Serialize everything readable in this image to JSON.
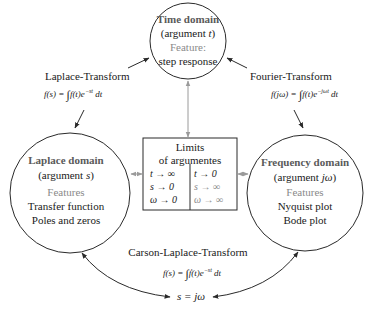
{
  "nodes": {
    "time_domain": {
      "title": "Time domain",
      "argument_prefix": "(argument ",
      "argument_symbol": "t",
      "argument_suffix": ")",
      "features_label": "Feature:",
      "features": [
        "step response"
      ]
    },
    "laplace_domain": {
      "title": "Laplace domain",
      "argument_prefix": "(argument ",
      "argument_symbol": "s",
      "argument_suffix": ")",
      "features_label": "Features",
      "features": [
        "Transfer function",
        "Poles and zeros"
      ]
    },
    "frequency_domain": {
      "title": "Frequency domain",
      "argument_prefix": "(argument ",
      "argument_symbol": "jω",
      "argument_suffix": ")",
      "features_label": "Features",
      "features": [
        "Nyquist plot",
        "Bode plot"
      ]
    },
    "limits_box": {
      "title_line1": "Limits",
      "title_line2": "of argumentes",
      "left_column": [
        "t → ∞",
        "s → 0",
        "ω → 0"
      ],
      "right_column": [
        "t → 0",
        "s → ∞",
        "ω → ∞"
      ]
    }
  },
  "edges": {
    "laplace_transform": {
      "label": "Laplace-Transform",
      "formula_lhs": "f(s) = ",
      "formula_rhs": "f(t)e",
      "formula_exp": "−st",
      "formula_dt": " dt",
      "int_upper": "∞",
      "int_lower": "−∞"
    },
    "fourier_transform": {
      "label": "Fourier-Transform",
      "formula_lhs": "f(jω) = ",
      "formula_rhs": "f(t)e",
      "formula_exp": "−jωt",
      "formula_dt": " dt",
      "int_upper": "∞",
      "int_lower": "−∞"
    },
    "carson_laplace_transform": {
      "label": "Carson-Laplace-Transform",
      "formula_lhs": "f(s) = ",
      "formula_rhs": "ḟ(t)e",
      "formula_exp": "−st",
      "formula_dt": " dt",
      "int_upper": "∞",
      "int_lower": "−∞",
      "substitution": "s = jω"
    }
  },
  "colors": {
    "line": "#2a2a2a",
    "gray_arrow": "#9a9a9a",
    "title_text": "#5a5a5a",
    "feature_label": "#8a8a8a"
  }
}
